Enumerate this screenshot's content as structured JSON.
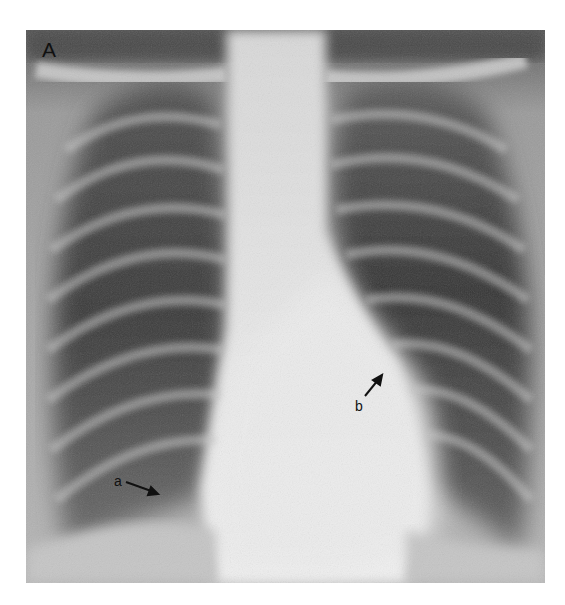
{
  "figure": {
    "panel_label": "A",
    "annotations": [
      {
        "label": "a",
        "arrow_direction": "right-down"
      },
      {
        "label": "b",
        "arrow_direction": "up-right"
      }
    ]
  },
  "colors": {
    "background": "#ffffff",
    "lung_dark": "#3c3c3c",
    "soft_tissue": "#9a9a9a",
    "mediastinum": "#e6e6e6",
    "label": "#111111"
  }
}
